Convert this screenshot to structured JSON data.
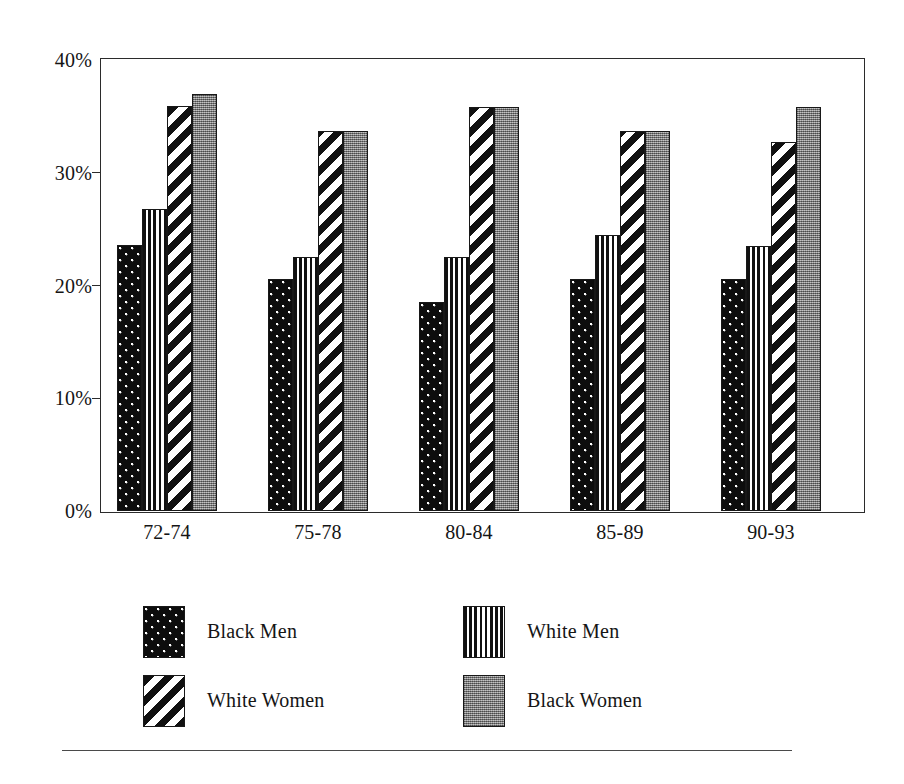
{
  "chart_data": {
    "type": "bar",
    "title": "",
    "subtitle": "",
    "xlabel": "",
    "ylabel": "",
    "categories": [
      "72-74",
      "75-78",
      "80-84",
      "85-89",
      "90-93"
    ],
    "series": [
      {
        "name": "Black Men",
        "pattern": "dotted-black",
        "color": "#0d0d0d",
        "values": [
          23.6,
          20.6,
          18.5,
          20.6,
          20.6
        ]
      },
      {
        "name": "White Men",
        "pattern": "vertical-stripes",
        "color": "#111111",
        "values": [
          26.8,
          22.5,
          22.5,
          24.5,
          23.5
        ]
      },
      {
        "name": "White Women",
        "pattern": "diagonal-stripes",
        "color": "#111111",
        "values": [
          35.9,
          33.7,
          35.8,
          33.7,
          32.7
        ]
      },
      {
        "name": "Black Women",
        "pattern": "gray-stipple",
        "color": "#8d8d8d",
        "values": [
          37.0,
          33.7,
          35.8,
          33.7,
          35.8
        ]
      }
    ],
    "ylim": [
      0,
      40
    ],
    "yticks": [
      0,
      10,
      20,
      30,
      40
    ],
    "ytick_labels": [
      "0%",
      "10%",
      "20%",
      "30%",
      "40%"
    ],
    "grid": false,
    "legend_position": "below-plot",
    "legend_layout": "2x2"
  },
  "axis": {
    "y_tick_labels": [
      "40%",
      "30%",
      "20%",
      "10%",
      "0%"
    ]
  },
  "legend": {
    "items": [
      {
        "label": "Black Men"
      },
      {
        "label": "White Men"
      },
      {
        "label": "White Women"
      },
      {
        "label": "Black Women"
      }
    ]
  }
}
